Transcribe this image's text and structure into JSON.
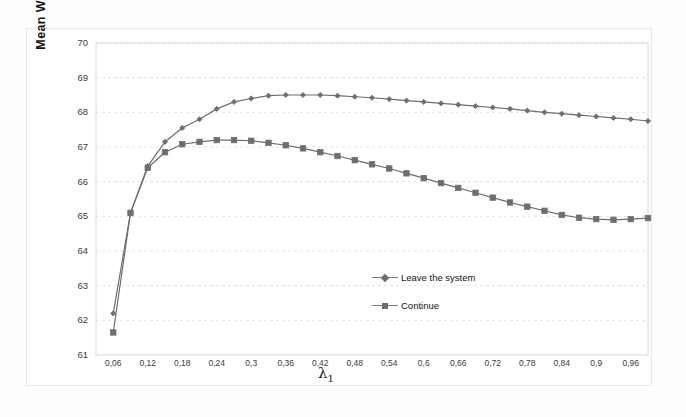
{
  "figure": {
    "background": "#ffffff",
    "frame_color": "#e9e9e9"
  },
  "axis": {
    "y_title": "Mean Waiting Time",
    "x_title": "λ",
    "x_title_sub": "1"
  },
  "legend": {
    "items": [
      {
        "label": "Leave the system",
        "marker": "diamond",
        "color": "#6e6e6e"
      },
      {
        "label": "Continue",
        "marker": "square",
        "color": "#6e6e6e"
      }
    ]
  },
  "chart_data": {
    "type": "line",
    "title": "",
    "xlabel": "λ1",
    "ylabel": "Mean Waiting Time",
    "xlim": [
      0.03,
      0.99
    ],
    "ylim": [
      61,
      70
    ],
    "ytick_step": 1,
    "grid": true,
    "grid_axis": "y",
    "legend_position": "inside-center-lower",
    "decimal_separator": ",",
    "ytick_labels": [
      "61",
      "62",
      "63",
      "64",
      "65",
      "66",
      "67",
      "68",
      "69",
      "70"
    ],
    "ytick_values": [
      61,
      62,
      63,
      64,
      65,
      66,
      67,
      68,
      69,
      70
    ],
    "xtick_labels": [
      "0,06",
      "0,12",
      "0,18",
      "0,24",
      "0,3",
      "0,36",
      "0,42",
      "0,48",
      "0,54",
      "0,6",
      "0,66",
      "0,72",
      "0,78",
      "0,84",
      "0,9",
      "0,96"
    ],
    "xtick_values": [
      0.06,
      0.12,
      0.18,
      0.24,
      0.3,
      0.36,
      0.42,
      0.48,
      0.54,
      0.6,
      0.66,
      0.72,
      0.78,
      0.84,
      0.9,
      0.96
    ],
    "x": [
      0.06,
      0.09,
      0.12,
      0.15,
      0.18,
      0.21,
      0.24,
      0.27,
      0.3,
      0.33,
      0.36,
      0.39,
      0.42,
      0.45,
      0.48,
      0.51,
      0.54,
      0.57,
      0.6,
      0.63,
      0.66,
      0.69,
      0.72,
      0.75,
      0.78,
      0.81,
      0.84,
      0.87,
      0.9,
      0.93,
      0.96,
      0.99
    ],
    "series": [
      {
        "name": "Leave the system",
        "marker": "diamond",
        "color": "#6e6e6e",
        "values": [
          62.2,
          65.1,
          66.45,
          67.15,
          67.55,
          67.8,
          68.1,
          68.3,
          68.4,
          68.48,
          68.5,
          68.5,
          68.5,
          68.48,
          68.45,
          68.42,
          68.38,
          68.34,
          68.3,
          68.26,
          68.22,
          68.18,
          68.14,
          68.1,
          68.05,
          68.0,
          67.96,
          67.92,
          67.88,
          67.84,
          67.8,
          67.75
        ]
      },
      {
        "name": "Continue",
        "marker": "square",
        "color": "#6e6e6e",
        "values": [
          61.65,
          65.1,
          66.4,
          66.85,
          67.08,
          67.15,
          67.2,
          67.2,
          67.18,
          67.12,
          67.05,
          66.96,
          66.85,
          66.74,
          66.62,
          66.5,
          66.38,
          66.24,
          66.1,
          65.96,
          65.82,
          65.68,
          65.54,
          65.4,
          65.28,
          65.16,
          65.04,
          64.96,
          64.92,
          64.9,
          64.92,
          64.95
        ]
      }
    ]
  }
}
